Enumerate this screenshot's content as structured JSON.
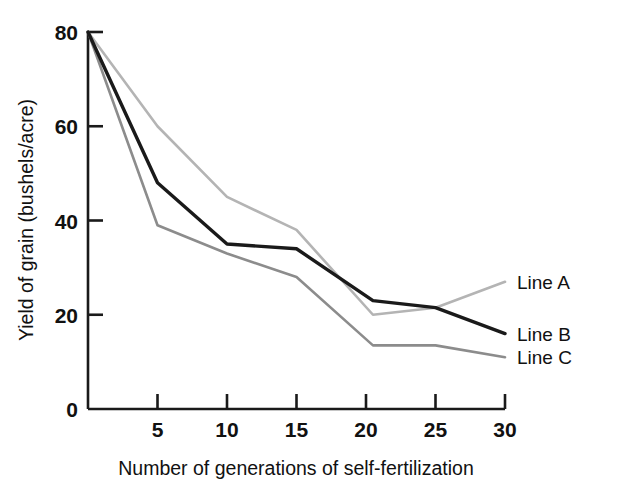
{
  "chart_data": {
    "type": "line",
    "title": "",
    "xlabel": "Number of generations of self-fertilization",
    "ylabel": "Yield of grain (bushels/acre)",
    "xlim": [
      0,
      30
    ],
    "ylim": [
      0,
      80
    ],
    "xticks": [
      5,
      10,
      15,
      20,
      25,
      30
    ],
    "xtick_labels": [
      "5",
      "10",
      "15",
      "20",
      "25",
      "30"
    ],
    "yticks": [
      0,
      20,
      40,
      60,
      80
    ],
    "ytick_labels": [
      "0",
      "20",
      "40",
      "60",
      "80"
    ],
    "grid": false,
    "legend_position": "right-inline",
    "series": [
      {
        "name": "Line A",
        "color": "#b4b4b4",
        "x": [
          0,
          5,
          10,
          15,
          20.5,
          25,
          30
        ],
        "values": [
          80,
          60,
          45,
          38,
          20,
          21.5,
          27
        ]
      },
      {
        "name": "Line B",
        "color": "#1a1a1a",
        "x": [
          0,
          5,
          10,
          15,
          20.5,
          25,
          30
        ],
        "values": [
          80,
          48,
          35,
          34,
          23,
          21.5,
          16
        ]
      },
      {
        "name": "Line C",
        "color": "#8c8c8c",
        "x": [
          0,
          5,
          10,
          15,
          20.5,
          25,
          30
        ],
        "values": [
          80,
          39,
          33,
          28,
          13.5,
          13.5,
          11
        ]
      }
    ]
  },
  "axis": {
    "line_color": "#1a1a1a",
    "x_label": "Number of generations of self-fertilization",
    "y_label": "Yield of grain (bushels/acre)"
  },
  "labels": {
    "series_a": "Line A",
    "series_b": "Line B",
    "series_c": "Line C"
  }
}
